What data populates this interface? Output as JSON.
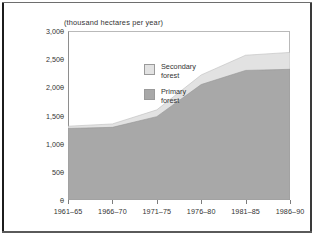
{
  "figure": {
    "unit_title": "(thousand hectares per year)"
  },
  "legend": {
    "items": [
      {
        "label_line1": "Secondary",
        "label_line2": "forest",
        "color": "#e2e2e2"
      },
      {
        "label_line1": "Primary",
        "label_line2": "forest",
        "color": "#a8a8a8"
      }
    ]
  },
  "axes": {
    "y_ticks": [
      "3,000",
      "2,500",
      "2,000",
      "1,500",
      "1,000",
      "500",
      "0"
    ],
    "x_ticks": [
      "1961–65",
      "1966–70",
      "1971–75",
      "1976–80",
      "1981–85",
      "1986–90"
    ]
  },
  "chart_data": {
    "type": "area",
    "title": "",
    "subtitle": "",
    "xlabel": "",
    "ylabel": "(thousand hectares per year)",
    "categories": [
      "1961–65",
      "1966–70",
      "1971–75",
      "1976–80",
      "1981–85",
      "1986–90"
    ],
    "series": [
      {
        "name": "Primary forest",
        "values": [
          1270,
          1290,
          1480,
          2050,
          2300,
          2320
        ],
        "color": "#a8a8a8"
      },
      {
        "name": "Secondary forest",
        "values": [
          40,
          60,
          120,
          170,
          270,
          300
        ],
        "color": "#e2e2e2"
      }
    ],
    "totals": [
      1310,
      1350,
      1600,
      2220,
      2570,
      2620
    ],
    "stacked": true,
    "ylim": [
      0,
      3000
    ],
    "ytick_values": [
      0,
      500,
      1000,
      1500,
      2000,
      2500,
      3000
    ],
    "grid": false,
    "legend_position": "inside-top-left"
  }
}
